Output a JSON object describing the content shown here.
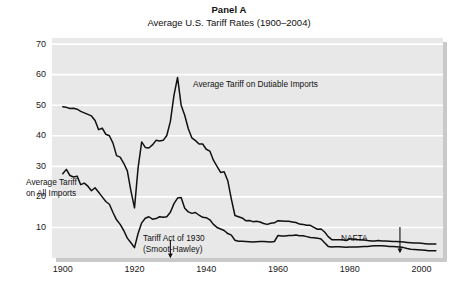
{
  "title": {
    "panel": "Panel A",
    "subtitle": "Average U.S. Tariff Rates (1900–2004)"
  },
  "annotations": {
    "dutiable": "Average Tariff on Dutiable Imports",
    "all_line1": "Average Tariff",
    "all_line2": "on All Imports",
    "smoot_line1": "Tariff Act of 1930",
    "smoot_line2": "(Smoot-Hawley)",
    "nafta": "NAFTA"
  },
  "axis": {
    "y_ticks": [
      "10",
      "20",
      "30",
      "40",
      "50",
      "60",
      "70"
    ],
    "x_ticks": [
      "1900",
      "1920",
      "1940",
      "1960",
      "1980",
      "2000"
    ]
  },
  "colors": {
    "plot_background": "#e8e8e8",
    "gridline": "#ffffff",
    "series_line": "#111111",
    "shadow": "#c9c9c9",
    "text": "#1a1a1a"
  },
  "chart_data": {
    "type": "line",
    "title": "Average U.S. Tariff Rates (1900–2004)",
    "xlabel": "",
    "ylabel": "",
    "xlim": [
      1897,
      2006
    ],
    "ylim": [
      0,
      72
    ],
    "y_ticks": [
      10,
      20,
      30,
      40,
      50,
      60,
      70
    ],
    "x_ticks": [
      1900,
      1920,
      1940,
      1960,
      1980,
      2000
    ],
    "grid": "horizontal",
    "legend": "annotations-inline",
    "series": [
      {
        "name": "Average Tariff on Dutiable Imports",
        "x": [
          1900,
          1901,
          1902,
          1903,
          1904,
          1905,
          1906,
          1907,
          1908,
          1909,
          1910,
          1911,
          1912,
          1913,
          1914,
          1915,
          1916,
          1917,
          1918,
          1919,
          1920,
          1921,
          1922,
          1923,
          1924,
          1925,
          1926,
          1927,
          1928,
          1929,
          1930,
          1931,
          1932,
          1933,
          1934,
          1935,
          1936,
          1937,
          1938,
          1939,
          1940,
          1941,
          1942,
          1943,
          1944,
          1945,
          1946,
          1947,
          1948,
          1949,
          1950,
          1951,
          1952,
          1953,
          1954,
          1955,
          1956,
          1957,
          1958,
          1959,
          1960,
          1961,
          1962,
          1963,
          1964,
          1965,
          1966,
          1967,
          1968,
          1969,
          1970,
          1971,
          1972,
          1973,
          1974,
          1975,
          1976,
          1977,
          1978,
          1979,
          1980,
          1981,
          1982,
          1983,
          1984,
          1985,
          1986,
          1987,
          1988,
          1989,
          1990,
          1991,
          1992,
          1993,
          1994,
          1995,
          1996,
          1997,
          1998,
          1999,
          2000,
          2001,
          2002,
          2003,
          2004
        ],
        "y": [
          49.5,
          49.3,
          48.9,
          49.0,
          48.7,
          48.0,
          47.5,
          47.0,
          46.5,
          45.0,
          42.0,
          42.5,
          40.5,
          40.0,
          37.6,
          33.5,
          33.0,
          31.0,
          28.5,
          22.0,
          16.4,
          29.5,
          38.0,
          36.2,
          36.0,
          37.0,
          38.5,
          38.3,
          38.5,
          40.1,
          44.7,
          53.2,
          59.1,
          50.0,
          46.7,
          42.3,
          39.3,
          38.4,
          37.3,
          37.3,
          35.6,
          35.0,
          32.0,
          30.0,
          28.0,
          28.2,
          25.3,
          19.3,
          13.9,
          13.5,
          13.1,
          12.2,
          12.3,
          11.9,
          12.0,
          11.8,
          11.3,
          11.0,
          11.4,
          11.5,
          12.2,
          12.1,
          12.0,
          12.0,
          11.8,
          11.6,
          11.1,
          11.0,
          10.7,
          10.7,
          10.0,
          9.4,
          9.5,
          8.5,
          7.0,
          6.0,
          6.0,
          6.0,
          6.0,
          5.7,
          6.3,
          6.1,
          6.0,
          6.0,
          5.9,
          5.7,
          5.6,
          5.6,
          5.7,
          5.6,
          5.6,
          5.5,
          5.4,
          5.4,
          5.3,
          5.2,
          5.1,
          5.0,
          4.9,
          4.9,
          4.8,
          4.7,
          4.6,
          4.6,
          4.6
        ]
      },
      {
        "name": "Average Tariff on All Imports",
        "x": [
          1900,
          1901,
          1902,
          1903,
          1904,
          1905,
          1906,
          1907,
          1908,
          1909,
          1910,
          1911,
          1912,
          1913,
          1914,
          1915,
          1916,
          1917,
          1918,
          1919,
          1920,
          1921,
          1922,
          1923,
          1924,
          1925,
          1926,
          1927,
          1928,
          1929,
          1930,
          1931,
          1932,
          1933,
          1934,
          1935,
          1936,
          1937,
          1938,
          1939,
          1940,
          1941,
          1942,
          1943,
          1944,
          1945,
          1946,
          1947,
          1948,
          1949,
          1950,
          1951,
          1952,
          1953,
          1954,
          1955,
          1956,
          1957,
          1958,
          1959,
          1960,
          1961,
          1962,
          1963,
          1964,
          1965,
          1966,
          1967,
          1968,
          1969,
          1970,
          1971,
          1972,
          1973,
          1974,
          1975,
          1976,
          1977,
          1978,
          1979,
          1980,
          1981,
          1982,
          1983,
          1984,
          1985,
          1986,
          1987,
          1988,
          1989,
          1990,
          1991,
          1992,
          1993,
          1994,
          1995,
          1996,
          1997,
          1998,
          1999,
          2000,
          2001,
          2002,
          2003,
          2004
        ],
        "y": [
          27.6,
          29.0,
          27.0,
          26.5,
          26.8,
          24.0,
          24.5,
          23.5,
          22.0,
          23.0,
          21.5,
          20.0,
          18.5,
          17.6,
          14.9,
          12.5,
          11.0,
          9.0,
          6.5,
          5.0,
          3.4,
          8.0,
          11.5,
          13.0,
          13.5,
          12.7,
          12.9,
          13.5,
          13.3,
          13.5,
          15.0,
          17.8,
          19.6,
          19.8,
          16.3,
          15.1,
          14.6,
          14.9,
          14.0,
          13.3,
          13.2,
          12.5,
          11.0,
          10.0,
          9.5,
          9.0,
          8.0,
          7.5,
          5.8,
          5.5,
          5.5,
          5.4,
          5.3,
          5.2,
          5.3,
          5.4,
          5.4,
          5.3,
          5.2,
          5.4,
          7.4,
          7.2,
          7.2,
          7.4,
          7.4,
          7.5,
          7.3,
          7.3,
          7.0,
          6.7,
          6.6,
          6.5,
          6.2,
          5.0,
          3.8,
          3.6,
          3.7,
          3.7,
          3.6,
          3.5,
          3.6,
          3.6,
          3.6,
          3.7,
          3.8,
          3.8,
          3.9,
          4.0,
          4.0,
          4.0,
          3.9,
          3.8,
          3.8,
          3.7,
          3.6,
          3.4,
          3.1,
          2.9,
          2.8,
          2.7,
          2.6,
          2.5,
          2.4,
          2.4,
          2.4
        ]
      }
    ],
    "event_markers": [
      {
        "label": "Tariff Act of 1930 (Smoot-Hawley)",
        "x": 1930
      },
      {
        "label": "NAFTA",
        "x": 1994
      }
    ]
  }
}
